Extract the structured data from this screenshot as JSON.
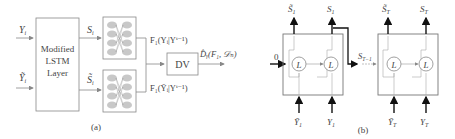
{
  "panel_a": {
    "caption": "(a)",
    "inputs": {
      "y": "Y",
      "y_sub": "i",
      "ytilde": "Ỹ",
      "ytilde_sub": "i"
    },
    "lstm_box": {
      "line1": "Modified",
      "line2": "LSTM",
      "line3": "Layer"
    },
    "states": {
      "s": "S",
      "s_sub": "i",
      "stilde": "S̃",
      "stilde_sub": "i"
    },
    "nn_outputs": {
      "top": "F₁(Yᵢ|Yⁱ⁻¹)",
      "bottom": "F₁(Ỹᵢ|Yⁱ⁻¹)"
    },
    "dv_box": "DV",
    "output": "D̂ᵧ(F₁, 𝒟ₙ)"
  },
  "panel_b": {
    "caption": "(b)",
    "initial_state": "0",
    "cell_label": "L",
    "block1": {
      "out_tilde": "S̃",
      "out_tilde_sub": "1",
      "out": "S",
      "out_sub": "1",
      "in_tilde": "Ỹ",
      "in_tilde_sub": "1",
      "in": "Y",
      "in_sub": "1"
    },
    "passing_state": {
      "label": "S",
      "sub": "T−1"
    },
    "block2": {
      "out_tilde": "S̃",
      "out_tilde_sub": "T",
      "out": "S",
      "out_sub": "T",
      "in_tilde": "Ỹ",
      "in_tilde_sub": "T",
      "in": "Y",
      "in_sub": "T"
    }
  }
}
